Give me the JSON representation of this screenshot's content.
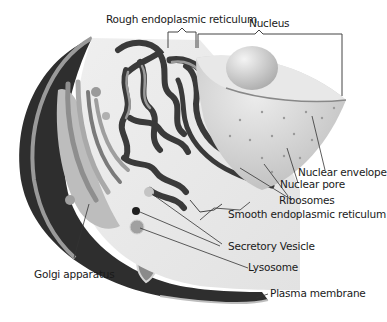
{
  "diagram": {
    "labels": {
      "rough_er": "Rough endoplasmic reticulum",
      "nucleus": "Nucleus",
      "nuclear_envelope": "Nuclear envelope",
      "nuclear_pore": "Nuclear pore",
      "ribosomes": "Ribosomes",
      "smooth_er": "Smooth endoplasmic reticulum",
      "secretory_vesicle": "Secretory Vesicle",
      "lysosome": "Lysosome",
      "golgi": "Golgi apparatus",
      "plasma_membrane": "Plasma membrane"
    },
    "colors": {
      "background": "#ffffff",
      "cytoplasm": "#e6e6e6",
      "membrane_dark": "#2e2e2e",
      "membrane_light": "#9a9a9a",
      "nucleus": "#d4d4d4",
      "nucleolus": "#c8c8c8",
      "er": "#3a3a3a",
      "golgi_light": "#bdbdbd",
      "leader_line": "#333333"
    }
  }
}
